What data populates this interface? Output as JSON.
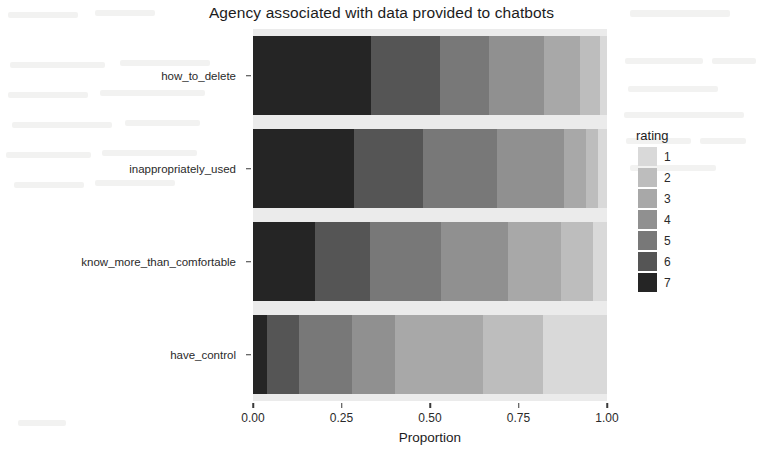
{
  "chart_data": {
    "type": "bar",
    "orientation": "horizontal",
    "stacked": true,
    "stack_mode": "fill",
    "title": "Agency associated with data provided to chatbots",
    "xlabel": "Proportion",
    "ylabel": "Agency",
    "xlim": [
      0,
      1
    ],
    "xticks": [
      "0.00",
      "0.25",
      "0.50",
      "0.75",
      "1.00"
    ],
    "xtick_values": [
      0,
      0.25,
      0.5,
      0.75,
      1
    ],
    "grid": false,
    "legend": {
      "title": "rating",
      "position": "right",
      "entries": [
        {
          "label": "1",
          "color": "#d9d9d9"
        },
        {
          "label": "2",
          "color": "#bdbdbd"
        },
        {
          "label": "3",
          "color": "#a8a8a8"
        },
        {
          "label": "4",
          "color": "#909090"
        },
        {
          "label": "5",
          "color": "#787878"
        },
        {
          "label": "6",
          "color": "#555555"
        },
        {
          "label": "7",
          "color": "#252525"
        }
      ]
    },
    "categories": [
      "have_control",
      "know_more_than_comfortable",
      "inappropriately_used",
      "how_to_delete"
    ],
    "category_order_top_to_bottom": [
      "how_to_delete",
      "inappropriately_used",
      "know_more_than_comfortable",
      "have_control"
    ],
    "series": [
      {
        "name": "7",
        "color": "#252525",
        "values": [
          0.333,
          0.285,
          0.175,
          0.04
        ]
      },
      {
        "name": "6",
        "color": "#555555",
        "values": [
          0.195,
          0.195,
          0.155,
          0.09
        ]
      },
      {
        "name": "5",
        "color": "#787878",
        "values": [
          0.14,
          0.21,
          0.2,
          0.15
        ]
      },
      {
        "name": "4",
        "color": "#909090",
        "values": [
          0.155,
          0.19,
          0.19,
          0.12
        ]
      },
      {
        "name": "3",
        "color": "#a8a8a8",
        "values": [
          0.1,
          0.06,
          0.15,
          0.25
        ]
      },
      {
        "name": "2",
        "color": "#bdbdbd",
        "values": [
          0.057,
          0.035,
          0.09,
          0.17
        ]
      },
      {
        "name": "1",
        "color": "#d9d9d9",
        "values": [
          0.02,
          0.025,
          0.04,
          0.18
        ]
      }
    ],
    "bars": [
      {
        "category": "how_to_delete",
        "segments": [
          {
            "rating": "7",
            "value": 0.333,
            "color": "#252525"
          },
          {
            "rating": "6",
            "value": 0.195,
            "color": "#555555"
          },
          {
            "rating": "5",
            "value": 0.14,
            "color": "#787878"
          },
          {
            "rating": "4",
            "value": 0.155,
            "color": "#909090"
          },
          {
            "rating": "3",
            "value": 0.1,
            "color": "#a8a8a8"
          },
          {
            "rating": "2",
            "value": 0.057,
            "color": "#bdbdbd"
          },
          {
            "rating": "1",
            "value": 0.02,
            "color": "#d9d9d9"
          }
        ]
      },
      {
        "category": "inappropriately_used",
        "segments": [
          {
            "rating": "7",
            "value": 0.285,
            "color": "#252525"
          },
          {
            "rating": "6",
            "value": 0.195,
            "color": "#555555"
          },
          {
            "rating": "5",
            "value": 0.21,
            "color": "#787878"
          },
          {
            "rating": "4",
            "value": 0.19,
            "color": "#909090"
          },
          {
            "rating": "3",
            "value": 0.06,
            "color": "#a8a8a8"
          },
          {
            "rating": "2",
            "value": 0.035,
            "color": "#bdbdbd"
          },
          {
            "rating": "1",
            "value": 0.025,
            "color": "#d9d9d9"
          }
        ]
      },
      {
        "category": "know_more_than_comfortable",
        "segments": [
          {
            "rating": "7",
            "value": 0.175,
            "color": "#252525"
          },
          {
            "rating": "6",
            "value": 0.155,
            "color": "#555555"
          },
          {
            "rating": "5",
            "value": 0.2,
            "color": "#787878"
          },
          {
            "rating": "4",
            "value": 0.19,
            "color": "#909090"
          },
          {
            "rating": "3",
            "value": 0.15,
            "color": "#a8a8a8"
          },
          {
            "rating": "2",
            "value": 0.09,
            "color": "#bdbdbd"
          },
          {
            "rating": "1",
            "value": 0.04,
            "color": "#d9d9d9"
          }
        ]
      },
      {
        "category": "have_control",
        "segments": [
          {
            "rating": "7",
            "value": 0.04,
            "color": "#252525"
          },
          {
            "rating": "6",
            "value": 0.09,
            "color": "#555555"
          },
          {
            "rating": "5",
            "value": 0.15,
            "color": "#787878"
          },
          {
            "rating": "4",
            "value": 0.12,
            "color": "#909090"
          },
          {
            "rating": "3",
            "value": 0.25,
            "color": "#a8a8a8"
          },
          {
            "rating": "2",
            "value": 0.17,
            "color": "#bdbdbd"
          },
          {
            "rating": "1",
            "value": 0.18,
            "color": "#d9d9d9"
          }
        ]
      }
    ]
  },
  "panel": {
    "background": "#ebebeb"
  }
}
